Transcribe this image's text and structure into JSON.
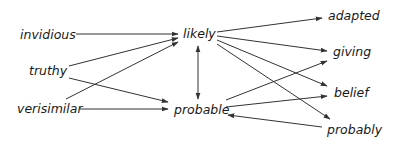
{
  "diagram": {
    "type": "directed-graph",
    "nodes": [
      {
        "id": "invidious",
        "label": "invidious",
        "x": 20,
        "y": 39,
        "anchor": "start"
      },
      {
        "id": "truthy",
        "label": "truthy",
        "x": 29,
        "y": 75,
        "anchor": "start"
      },
      {
        "id": "verisimilar",
        "label": "verisimilar",
        "x": 17,
        "y": 113,
        "anchor": "start"
      },
      {
        "id": "likely",
        "label": "likely",
        "x": 183,
        "y": 38,
        "anchor": "start"
      },
      {
        "id": "probable",
        "label": "probable",
        "x": 174,
        "y": 114,
        "anchor": "start"
      },
      {
        "id": "adapted",
        "label": "adapted",
        "x": 328,
        "y": 20,
        "anchor": "start"
      },
      {
        "id": "giving",
        "label": "giving",
        "x": 333,
        "y": 56,
        "anchor": "start"
      },
      {
        "id": "belief",
        "label": "belief",
        "x": 334,
        "y": 97,
        "anchor": "start"
      },
      {
        "id": "probably",
        "label": "probably",
        "x": 327,
        "y": 134,
        "anchor": "start"
      }
    ],
    "edges": [
      {
        "from": "invidious",
        "to": "likely",
        "x1": 76,
        "y1": 34,
        "x2": 178,
        "y2": 34
      },
      {
        "from": "truthy",
        "to": "likely",
        "x1": 69,
        "y1": 66,
        "x2": 178,
        "y2": 38
      },
      {
        "from": "truthy",
        "to": "probable",
        "x1": 69,
        "y1": 78,
        "x2": 168,
        "y2": 102
      },
      {
        "from": "verisimilar",
        "to": "likely",
        "x1": 66,
        "y1": 99,
        "x2": 178,
        "y2": 42
      },
      {
        "from": "verisimilar",
        "to": "probable",
        "x1": 80,
        "y1": 109,
        "x2": 168,
        "y2": 109
      },
      {
        "from": "likely",
        "to": "probable",
        "x1": 198,
        "y1": 46,
        "x2": 198,
        "y2": 99,
        "bidirectional": true
      },
      {
        "from": "likely",
        "to": "adapted",
        "x1": 217,
        "y1": 32,
        "x2": 322,
        "y2": 18
      },
      {
        "from": "likely",
        "to": "giving",
        "x1": 217,
        "y1": 36,
        "x2": 327,
        "y2": 51
      },
      {
        "from": "likely",
        "to": "belief",
        "x1": 217,
        "y1": 40,
        "x2": 327,
        "y2": 86
      },
      {
        "from": "likely",
        "to": "probably",
        "x1": 217,
        "y1": 44,
        "x2": 330,
        "y2": 119
      },
      {
        "from": "probable",
        "to": "giving",
        "x1": 226,
        "y1": 100,
        "x2": 327,
        "y2": 61
      },
      {
        "from": "probable",
        "to": "belief",
        "x1": 226,
        "y1": 107,
        "x2": 327,
        "y2": 96
      },
      {
        "from": "probably",
        "to": "probable",
        "x1": 322,
        "y1": 127,
        "x2": 228,
        "y2": 115
      }
    ],
    "colors": {
      "edge": "#333333",
      "text": "#1a1a1a",
      "background": "#ffffff"
    }
  }
}
